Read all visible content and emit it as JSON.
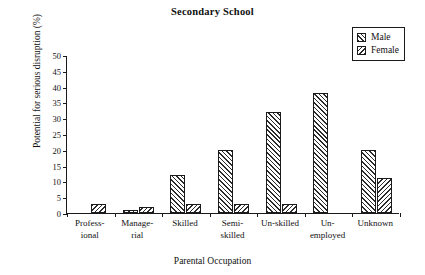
{
  "chart_data": {
    "type": "bar",
    "title": "Secondary School",
    "xlabel": "Parental Occupation",
    "ylabel": "Potential for serious disruption (%)",
    "ylim": [
      0,
      50
    ],
    "yticks": [
      0,
      5,
      10,
      15,
      20,
      25,
      30,
      35,
      40,
      45,
      50
    ],
    "grid": false,
    "legend_position": "top-right",
    "categories": [
      "Profess-\nional",
      "Manage-\nrial",
      "Skilled",
      "Semi-\nskilled",
      "Un-skilled",
      "Un-\nemployed",
      "Unknown"
    ],
    "category_lines": [
      [
        "Profess-",
        "ional"
      ],
      [
        "Manage-",
        "rial"
      ],
      [
        "Skilled"
      ],
      [
        "Semi-",
        "skilled"
      ],
      [
        "Un-skilled"
      ],
      [
        "Un-",
        "employed"
      ],
      [
        "Unknown"
      ]
    ],
    "series": [
      {
        "name": "Male",
        "pattern": "diagonal-hatch-up",
        "values": [
          0,
          1,
          12,
          20,
          32,
          38,
          20
        ]
      },
      {
        "name": "Female",
        "pattern": "diagonal-hatch-down",
        "values": [
          3,
          2,
          3,
          3,
          3,
          0,
          11
        ]
      }
    ]
  },
  "legend": {
    "items": [
      {
        "label": "Male"
      },
      {
        "label": "Female"
      }
    ]
  },
  "colors": {
    "axis": "#1a1a1a",
    "hatch": "#2b2b2b",
    "background": "#ffffff"
  }
}
